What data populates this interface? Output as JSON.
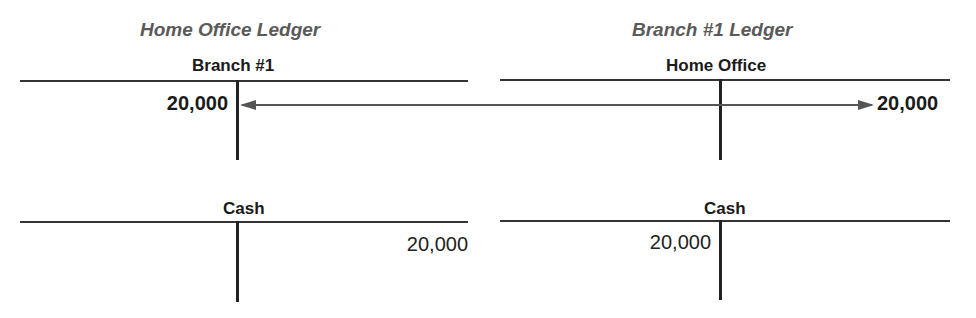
{
  "ledgers": [
    {
      "title": "Home Office Ledger",
      "accounts": [
        {
          "name": "Branch #1",
          "debit": "20,000",
          "credit": ""
        },
        {
          "name": "Cash",
          "debit": "",
          "credit": "20,000"
        }
      ]
    },
    {
      "title": "Branch #1 Ledger",
      "accounts": [
        {
          "name": "Home Office",
          "debit": "",
          "credit": "20,000"
        },
        {
          "name": "Cash",
          "debit": "20,000",
          "credit": ""
        }
      ]
    }
  ],
  "connector": {
    "from": "Home Office Ledger / Branch #1 debit",
    "to": "Branch #1 Ledger / Home Office credit",
    "style": "double-headed arrow",
    "color": "#555555"
  }
}
